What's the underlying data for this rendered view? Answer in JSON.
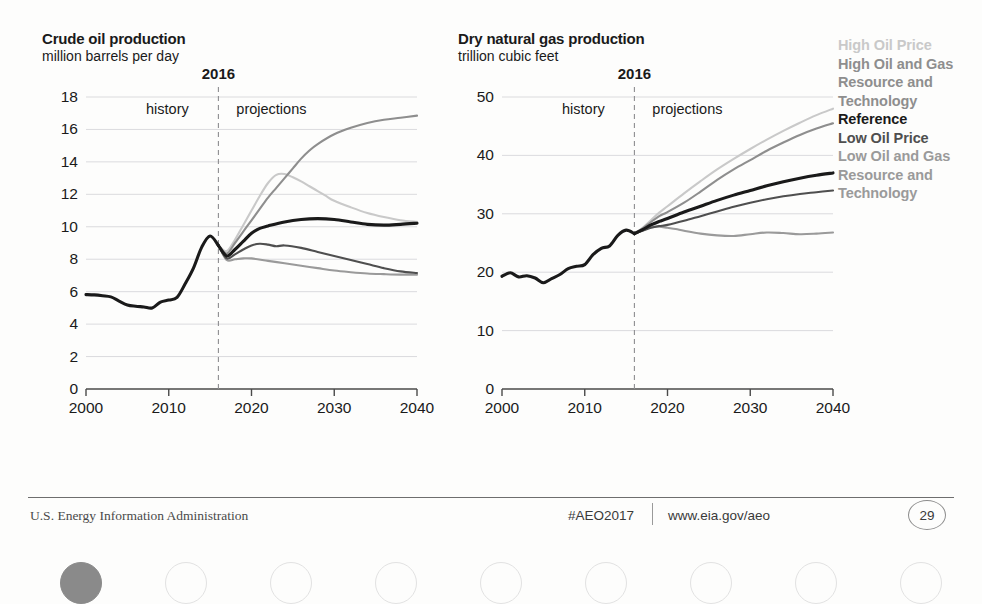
{
  "legend": {
    "items": [
      {
        "label": "High Oil Price",
        "color": "#c9c9c9"
      },
      {
        "label": "High Oil and Gas Resource and Technology",
        "color": "#8e8e8e"
      },
      {
        "label": "Reference",
        "color": "#1a1a1a"
      },
      {
        "label": "Low Oil Price",
        "color": "#4f4f4f"
      },
      {
        "label": "Low Oil and Gas Resource and Technology",
        "color": "#9a9a9a"
      }
    ]
  },
  "footer": {
    "agency": "U.S. Energy Information Administration",
    "hashtag": "#AEO2017",
    "url": "www.eia.gov/aeo",
    "page": "29"
  },
  "pagination": {
    "count": 9,
    "active_index": 0
  },
  "chart_data": [
    {
      "id": "crude-oil",
      "type": "line",
      "title": "Crude oil production",
      "subtitle": "million barrels per day",
      "xlabel": "",
      "ylabel": "million barrels per day",
      "xlim": [
        2000,
        2040
      ],
      "ylim": [
        0,
        18
      ],
      "yticks": [
        0,
        2,
        4,
        6,
        8,
        10,
        12,
        14,
        16,
        18
      ],
      "xticks": [
        2000,
        2010,
        2020,
        2030,
        2040
      ],
      "grid": true,
      "legend_position": "right",
      "divider": {
        "x": 2016,
        "label": "2016",
        "left_label": "history",
        "right_label": "projections"
      },
      "history": {
        "name": "history",
        "color": "#1a1a1a",
        "x": [
          2000,
          2001,
          2002,
          2003,
          2004,
          2005,
          2006,
          2007,
          2008,
          2009,
          2010,
          2011,
          2012,
          2013,
          2014,
          2015,
          2016
        ],
        "values": [
          5.82,
          5.8,
          5.75,
          5.68,
          5.42,
          5.18,
          5.1,
          5.06,
          5.0,
          5.36,
          5.48,
          5.65,
          6.5,
          7.47,
          8.76,
          9.43,
          8.85
        ]
      },
      "series": [
        {
          "name": "High Oil Price",
          "color": "#c9c9c9",
          "x": [
            2016,
            2017,
            2018,
            2019,
            2020,
            2021,
            2022,
            2023,
            2024,
            2025,
            2026,
            2027,
            2028,
            2029,
            2030,
            2032,
            2034,
            2036,
            2038,
            2040
          ],
          "values": [
            8.85,
            8.5,
            9.2,
            10.1,
            11.0,
            11.9,
            12.7,
            13.2,
            13.25,
            13.05,
            12.8,
            12.5,
            12.2,
            11.9,
            11.6,
            11.2,
            10.85,
            10.6,
            10.4,
            10.3
          ]
        },
        {
          "name": "High Oil and Gas Resource and Technology",
          "color": "#8e8e8e",
          "x": [
            2016,
            2017,
            2018,
            2019,
            2020,
            2021,
            2022,
            2023,
            2024,
            2025,
            2026,
            2027,
            2028,
            2030,
            2032,
            2034,
            2036,
            2038,
            2040
          ],
          "values": [
            8.85,
            8.35,
            9.0,
            9.7,
            10.4,
            11.1,
            11.8,
            12.4,
            13.0,
            13.6,
            14.2,
            14.7,
            15.1,
            15.7,
            16.1,
            16.4,
            16.6,
            16.72,
            16.85
          ]
        },
        {
          "name": "Reference",
          "color": "#1a1a1a",
          "x": [
            2016,
            2017,
            2018,
            2019,
            2020,
            2021,
            2022,
            2024,
            2026,
            2028,
            2030,
            2032,
            2034,
            2036,
            2038,
            2040
          ],
          "values": [
            8.85,
            8.2,
            8.6,
            9.1,
            9.6,
            9.9,
            10.05,
            10.3,
            10.45,
            10.5,
            10.45,
            10.3,
            10.15,
            10.1,
            10.15,
            10.22
          ]
        },
        {
          "name": "Low Oil Price",
          "color": "#4f4f4f",
          "x": [
            2016,
            2017,
            2018,
            2019,
            2020,
            2021,
            2022,
            2023,
            2024,
            2026,
            2028,
            2030,
            2032,
            2034,
            2036,
            2038,
            2040
          ],
          "values": [
            8.85,
            8.05,
            8.3,
            8.6,
            8.85,
            8.95,
            8.9,
            8.8,
            8.85,
            8.7,
            8.45,
            8.2,
            7.95,
            7.7,
            7.45,
            7.25,
            7.15
          ]
        },
        {
          "name": "Low Oil and Gas Resource and Technology",
          "color": "#9a9a9a",
          "x": [
            2016,
            2017,
            2018,
            2019,
            2020,
            2022,
            2024,
            2026,
            2028,
            2030,
            2032,
            2034,
            2036,
            2038,
            2040
          ],
          "values": [
            8.85,
            7.95,
            8.0,
            8.05,
            8.05,
            7.9,
            7.75,
            7.6,
            7.45,
            7.3,
            7.2,
            7.12,
            7.08,
            7.05,
            7.05
          ]
        }
      ]
    },
    {
      "id": "dry-natural-gas",
      "type": "line",
      "title": "Dry natural gas production",
      "subtitle": "trillion cubic feet",
      "xlabel": "",
      "ylabel": "trillion cubic feet",
      "xlim": [
        2000,
        2040
      ],
      "ylim": [
        0,
        50
      ],
      "yticks": [
        0,
        10,
        20,
        30,
        40,
        50
      ],
      "xticks": [
        2000,
        2010,
        2020,
        2030,
        2040
      ],
      "grid": true,
      "legend_position": "right",
      "divider": {
        "x": 2016,
        "label": "2016",
        "left_label": "history",
        "right_label": "projections"
      },
      "history": {
        "name": "history",
        "color": "#1a1a1a",
        "x": [
          2000,
          2001,
          2002,
          2003,
          2004,
          2005,
          2006,
          2007,
          2008,
          2009,
          2010,
          2011,
          2012,
          2013,
          2014,
          2015,
          2016
        ],
        "values": [
          19.3,
          19.9,
          19.2,
          19.4,
          19.0,
          18.2,
          18.9,
          19.6,
          20.6,
          21.0,
          21.3,
          23.0,
          24.1,
          24.5,
          26.3,
          27.2,
          26.6
        ]
      },
      "series": [
        {
          "name": "High Oil Price",
          "color": "#c9c9c9",
          "x": [
            2016,
            2017,
            2018,
            2019,
            2020,
            2022,
            2024,
            2026,
            2028,
            2030,
            2032,
            2034,
            2036,
            2038,
            2040
          ],
          "values": [
            26.6,
            27.6,
            28.9,
            30.2,
            31.3,
            33.5,
            35.6,
            37.6,
            39.4,
            41.1,
            42.7,
            44.2,
            45.6,
            46.9,
            48.0
          ]
        },
        {
          "name": "High Oil and Gas Resource and Technology",
          "color": "#8e8e8e",
          "x": [
            2016,
            2017,
            2018,
            2019,
            2020,
            2022,
            2024,
            2026,
            2028,
            2030,
            2032,
            2034,
            2036,
            2038,
            2040
          ],
          "values": [
            26.6,
            27.5,
            28.6,
            29.6,
            30.3,
            31.9,
            33.8,
            35.8,
            37.6,
            39.2,
            40.8,
            42.2,
            43.5,
            44.6,
            45.5
          ]
        },
        {
          "name": "Reference",
          "color": "#1a1a1a",
          "x": [
            2016,
            2017,
            2018,
            2019,
            2020,
            2022,
            2024,
            2026,
            2028,
            2030,
            2032,
            2034,
            2036,
            2038,
            2040
          ],
          "values": [
            26.6,
            27.3,
            28.1,
            28.7,
            29.2,
            30.3,
            31.3,
            32.3,
            33.2,
            34.0,
            34.8,
            35.5,
            36.1,
            36.6,
            37.0
          ]
        },
        {
          "name": "Low Oil Price",
          "color": "#4f4f4f",
          "x": [
            2016,
            2017,
            2018,
            2019,
            2020,
            2022,
            2024,
            2026,
            2028,
            2030,
            2032,
            2034,
            2036,
            2038,
            2040
          ],
          "values": [
            26.6,
            27.1,
            27.6,
            27.9,
            28.1,
            28.8,
            29.6,
            30.4,
            31.2,
            31.9,
            32.5,
            33.0,
            33.4,
            33.7,
            34.0
          ]
        },
        {
          "name": "Low Oil and Gas Resource and Technology",
          "color": "#9a9a9a",
          "x": [
            2016,
            2017,
            2018,
            2019,
            2020,
            2021,
            2022,
            2024,
            2026,
            2028,
            2030,
            2032,
            2034,
            2036,
            2038,
            2040
          ],
          "values": [
            26.6,
            27.2,
            27.7,
            27.8,
            27.6,
            27.4,
            27.1,
            26.6,
            26.3,
            26.2,
            26.5,
            26.8,
            26.7,
            26.5,
            26.6,
            26.8
          ]
        }
      ]
    }
  ]
}
